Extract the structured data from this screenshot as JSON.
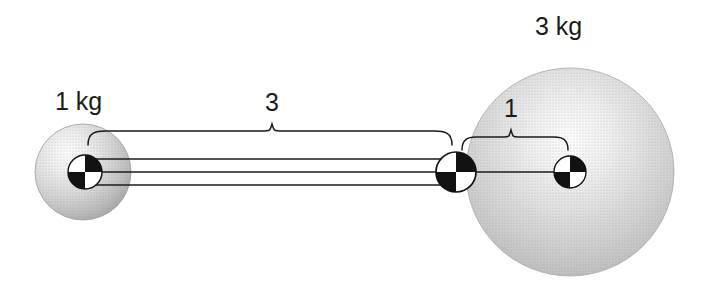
{
  "figure": {
    "type": "physics-diagram",
    "title": "",
    "background_color": "#ffffff",
    "line_color": "#1b1b1b",
    "sphere_fill_light": "#fdfdfd",
    "sphere_fill_mid": "#d2d2d2",
    "sphere_fill_dark": "#9a9a9a"
  },
  "bodies": [
    {
      "id": "small-sphere",
      "mass_label": "1 kg",
      "cx": 83,
      "cy": 172,
      "r": 48
    },
    {
      "id": "large-sphere",
      "mass_label": "3 kg",
      "cx": 570,
      "cy": 172,
      "r": 104
    }
  ],
  "com_markers": [
    {
      "id": "com-small-sphere",
      "cx": 85,
      "cy": 172,
      "r": 17
    },
    {
      "id": "com-system",
      "cx": 456,
      "cy": 172,
      "r": 20
    },
    {
      "id": "com-large-sphere",
      "cx": 570,
      "cy": 172,
      "r": 16
    }
  ],
  "connector": {
    "id": "rigid-rod",
    "x_start": 85,
    "x_end": 456,
    "line_offsets": [
      -13,
      0,
      13
    ]
  },
  "dimensions": [
    {
      "id": "distance-3",
      "value": "3",
      "label_x": 272,
      "label_y": 111,
      "brace_left": 88,
      "brace_right": 452,
      "brace_y": 131
    },
    {
      "id": "distance-1",
      "value": "1",
      "label_x": 510,
      "label_y": 117,
      "brace_left": 462,
      "brace_right": 568,
      "brace_y": 137
    }
  ],
  "labels": {
    "small_mass": {
      "text": "1 kg",
      "x": 55,
      "y": 110
    },
    "large_mass": {
      "text": "3 kg",
      "x": 535,
      "y": 35
    }
  }
}
